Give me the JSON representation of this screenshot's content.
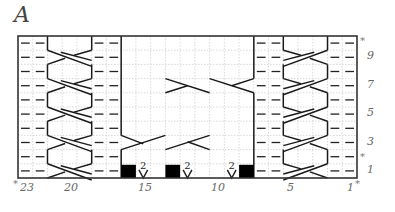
{
  "chart": {
    "label": "A",
    "grid": {
      "cols": 23,
      "rows": 10,
      "left": 18,
      "top": 36,
      "right": 357,
      "bottom": 178
    },
    "column_labels": [
      {
        "text": "23",
        "col": 23,
        "x": 20
      },
      {
        "text": "20",
        "col": 20,
        "x": 64
      },
      {
        "text": "15",
        "col": 15,
        "x": 138
      },
      {
        "text": "10",
        "col": 10,
        "x": 211
      },
      {
        "text": "5",
        "col": 5,
        "x": 287
      },
      {
        "text": "1",
        "col": 1,
        "x": 347
      }
    ],
    "row_labels": [
      {
        "text": "9",
        "row": 9
      },
      {
        "text": "7",
        "row": 7
      },
      {
        "text": "5",
        "row": 5
      },
      {
        "text": "3",
        "row": 3
      },
      {
        "text": "1",
        "row": 1
      }
    ],
    "repeat_markers": {
      "symbol": "*",
      "bottom_left": "*",
      "bottom_right": "*",
      "right_top": "*",
      "right_row3": "*"
    },
    "blocks": [
      {
        "name": "left-panel",
        "cols": "23-17",
        "purl_cols": [
          23,
          22,
          18,
          17
        ],
        "cable_cols": [
          21,
          20,
          19
        ]
      },
      {
        "name": "center-panel",
        "cols": "16-8"
      },
      {
        "name": "right-panel",
        "cols": "7-1",
        "purl_cols": [
          7,
          6,
          2,
          1
        ],
        "cable_cols": [
          5,
          4,
          3
        ]
      }
    ],
    "row1_symbols": [
      {
        "type": "black-square",
        "col": 16
      },
      {
        "type": "increase-v",
        "col": 15,
        "count": "2"
      },
      {
        "type": "black-square",
        "col": 13
      },
      {
        "type": "increase-v",
        "col": 12,
        "count": "2"
      },
      {
        "type": "increase-v",
        "col": 9,
        "count": "2"
      },
      {
        "type": "black-square",
        "col": 8
      }
    ],
    "colors": {
      "line": "#1a1a1a",
      "grid": "#c8c8c8",
      "purl": "#222222",
      "fill": "#000000"
    }
  }
}
